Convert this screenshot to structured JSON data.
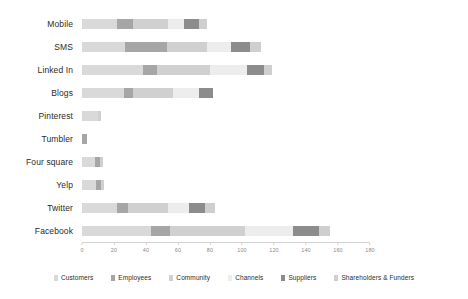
{
  "chart_data": {
    "type": "bar",
    "orientation": "horizontal",
    "stacked": true,
    "title": "",
    "xlabel": "",
    "ylabel": "",
    "xlim": [
      0,
      180
    ],
    "grid": false,
    "legend_position": "bottom",
    "categories": [
      "Mobile",
      "SMS",
      "Linked In",
      "Blogs",
      "Pinterest",
      "Tumbler",
      "Four square",
      "Yelp",
      "Twitter",
      "Facebook"
    ],
    "xticks": [
      0,
      20,
      40,
      60,
      80,
      100,
      120,
      140,
      160,
      180
    ],
    "xtick_labels": [
      "0",
      "20",
      "40",
      "60",
      "80",
      "100",
      "120",
      "140",
      "160",
      "180"
    ],
    "series": [
      {
        "name": "Customers",
        "color": "#d9d9d9",
        "values": [
          22,
          27,
          38,
          26,
          10,
          0,
          8,
          9,
          22,
          43
        ]
      },
      {
        "name": "Employees",
        "color": "#a6a6a6",
        "values": [
          10,
          26,
          9,
          6,
          0,
          3,
          3,
          3,
          7,
          12
        ]
      },
      {
        "name": "Community",
        "color": "#d0d0d0",
        "values": [
          22,
          25,
          33,
          25,
          2,
          0,
          2,
          2,
          25,
          47
        ]
      },
      {
        "name": "Channels",
        "color": "#ededed",
        "values": [
          10,
          15,
          23,
          16,
          0,
          0,
          0,
          0,
          13,
          30
        ]
      },
      {
        "name": "Suppliers",
        "color": "#8c8c8c",
        "values": [
          9,
          12,
          11,
          9,
          0,
          0,
          0,
          0,
          10,
          16
        ]
      },
      {
        "name": "Shareholders & Funders",
        "color": "#cfcfcf",
        "values": [
          5,
          7,
          5,
          0,
          0,
          0,
          0,
          0,
          6,
          7
        ]
      }
    ],
    "totals": [
      78,
      112,
      119,
      82,
      12,
      3,
      13,
      14,
      83,
      155
    ]
  },
  "legend": {
    "items": [
      {
        "label": "Customers"
      },
      {
        "label": "Employees"
      },
      {
        "label": "Community"
      },
      {
        "label": "Channels"
      },
      {
        "label": "Suppliers"
      },
      {
        "label": "Shareholders & Funders"
      }
    ]
  }
}
